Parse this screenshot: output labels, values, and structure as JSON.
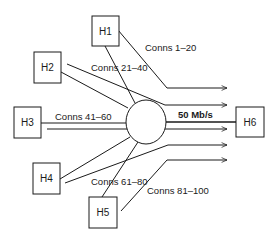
{
  "diagram": {
    "type": "network-topology",
    "colors": {
      "stroke": "#1a1a1a",
      "background": "#ffffff"
    },
    "hosts": [
      {
        "id": "H1",
        "label": "H1"
      },
      {
        "id": "H2",
        "label": "H2"
      },
      {
        "id": "H3",
        "label": "H3"
      },
      {
        "id": "H4",
        "label": "H4"
      },
      {
        "id": "H5",
        "label": "H5"
      },
      {
        "id": "H6",
        "label": "H6"
      }
    ],
    "router": {
      "label": ""
    },
    "bottleneck_link": {
      "from": "router",
      "to": "H6",
      "label": "50 Mb/s"
    },
    "connection_groups": [
      {
        "from": "H1",
        "label": "Conns 1–20"
      },
      {
        "from": "H2",
        "label": "Conns 21–40"
      },
      {
        "from": "H3",
        "label": "Conns 41–60"
      },
      {
        "from": "H4",
        "label": "Conns 61–80"
      },
      {
        "from": "H5",
        "label": "Conns 81–100"
      }
    ]
  }
}
